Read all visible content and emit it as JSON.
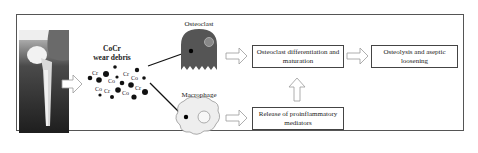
{
  "debris": {
    "title_line1": "CoCr",
    "title_line2": "wear debris",
    "particle_labels": [
      "Cr",
      "Co",
      "Cr",
      "Co",
      "Co",
      "Cr",
      "Co",
      "Cr"
    ]
  },
  "cells": {
    "osteoclast_label": "Osteoclast",
    "macrophage_label": "Macrophage"
  },
  "boxes": {
    "differentiation": "Osteoclast differentiation and maturation",
    "osteolysis": "Osteolysis and aseptic loosening",
    "mediators": "Release of proinflammatory mediators"
  },
  "colors": {
    "osteoclast_fill": "#555555",
    "macrophage_fill": "#eeeeee",
    "arrow_outline": "#999999",
    "frame": "#555555"
  }
}
